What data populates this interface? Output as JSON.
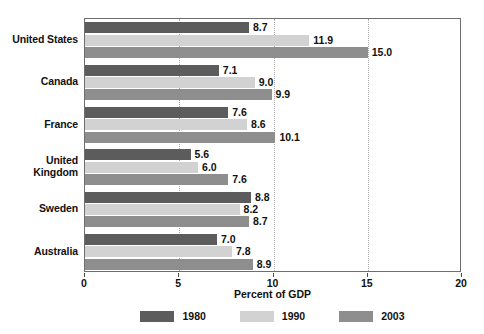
{
  "chart_data": {
    "type": "bar",
    "orientation": "horizontal",
    "title": "",
    "xlabel": "Percent of GDP",
    "ylabel": "",
    "xlim": [
      0,
      20
    ],
    "xticks": [
      0,
      5,
      10,
      15,
      20
    ],
    "xtick_labels": [
      "0",
      "5",
      "10",
      "15",
      "20"
    ],
    "gridlines": [
      5,
      10,
      15
    ],
    "grid": true,
    "grid_style": "dotted",
    "legend_position": "bottom",
    "categories": [
      "United States",
      "Canada",
      "France",
      "United Kingdom",
      "Sweden",
      "Australia"
    ],
    "category_label_lines": [
      [
        "United States"
      ],
      [
        "Canada"
      ],
      [
        "France"
      ],
      [
        "United",
        "Kingdom"
      ],
      [
        "Sweden"
      ],
      [
        "Australia"
      ]
    ],
    "series": [
      {
        "name": "1980",
        "color": "#5c5c5c",
        "values": [
          8.7,
          7.1,
          7.6,
          5.6,
          8.8,
          7.0
        ],
        "labels": [
          "8.7",
          "7.1",
          "7.6",
          "5.6",
          "8.8",
          "7.0"
        ]
      },
      {
        "name": "1990",
        "color": "#d2d2d2",
        "values": [
          11.9,
          9.0,
          8.6,
          6.0,
          8.2,
          7.8
        ],
        "labels": [
          "11.9",
          "9.0",
          "8.6",
          "6.0",
          "8.2",
          "7.8"
        ]
      },
      {
        "name": "2003",
        "color": "#8e8e8e",
        "values": [
          15.0,
          9.9,
          10.1,
          7.6,
          8.7,
          8.9
        ],
        "labels": [
          "15.0",
          "9.9",
          "10.1",
          "7.6",
          "8.7",
          "8.9"
        ]
      }
    ]
  },
  "legend": {
    "items": [
      {
        "label": "1980",
        "color": "#5c5c5c"
      },
      {
        "label": "1990",
        "color": "#d2d2d2"
      },
      {
        "label": "2003",
        "color": "#8e8e8e"
      }
    ]
  },
  "axis": {
    "x_title": "Percent of GDP"
  }
}
